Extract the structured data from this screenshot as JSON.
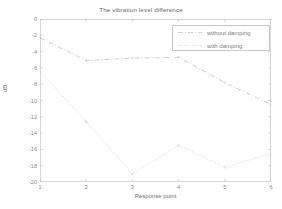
{
  "chart_data": {
    "type": "line",
    "title": "The vibration level difference",
    "xlabel": "Response point",
    "ylabel": "dB",
    "xlim": [
      1,
      6
    ],
    "ylim": [
      -20,
      0
    ],
    "xticks": [
      "1",
      "2",
      "3",
      "4",
      "5",
      "6"
    ],
    "yticks": [
      "0",
      "-2",
      "-4",
      "-6",
      "-8",
      "-10",
      "-12",
      "-14",
      "-16",
      "-18",
      "-20"
    ],
    "grid": false,
    "legend_position": "upper right",
    "x": [
      1,
      2,
      3,
      4,
      5,
      6
    ],
    "series": [
      {
        "name": "without damping",
        "values": [
          -2.3,
          -5.1,
          -4.8,
          -4.7,
          -7.8,
          -10.5
        ],
        "color": "#c8c8c8",
        "linestyle": "dashdot"
      },
      {
        "name": "with damping",
        "values": [
          -6.4,
          -12.6,
          -19.0,
          -15.5,
          -18.2,
          -16.5
        ],
        "color": "#d2d2d2",
        "linestyle": "dotted"
      }
    ]
  },
  "legend": {
    "entries": [
      {
        "label": "without damping"
      },
      {
        "label": "with damping"
      }
    ]
  },
  "axes": {
    "x_label": "Response point",
    "y_label": "dB"
  }
}
